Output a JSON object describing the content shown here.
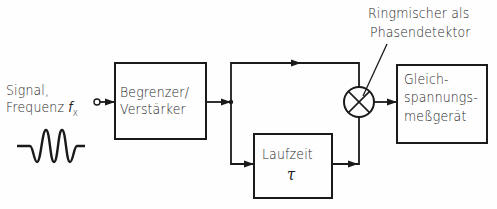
{
  "diagram": {
    "type": "block-diagram",
    "input": {
      "label_line1": "Signal,",
      "label_line2": "Frequenz",
      "freq_symbol": "f",
      "freq_subscript": "x",
      "waveform": "sine-burst"
    },
    "blocks": [
      {
        "id": "limiter",
        "line1": "Begrenzer/",
        "line2": "Verstärker"
      },
      {
        "id": "delay",
        "line1": "Laufzeit",
        "line2": "τ"
      },
      {
        "id": "dc-meter",
        "line1": "Gleich-",
        "line2": "spannungs-",
        "line3": "meßgerät"
      }
    ],
    "mixer": {
      "symbol": "circle-with-cross",
      "annotation_line1": "Ringmischer als",
      "annotation_line2": "Phasendetektor"
    },
    "connections": [
      {
        "from": "input",
        "to": "limiter"
      },
      {
        "from": "limiter",
        "to": "junction"
      },
      {
        "from": "junction",
        "to": "mixer",
        "path": "upper direct"
      },
      {
        "from": "junction",
        "to": "delay",
        "path": "lower"
      },
      {
        "from": "delay",
        "to": "mixer"
      },
      {
        "from": "mixer",
        "to": "dc-meter"
      }
    ],
    "colors": {
      "line": "#1a1a1a",
      "background": "#fefefe"
    }
  }
}
